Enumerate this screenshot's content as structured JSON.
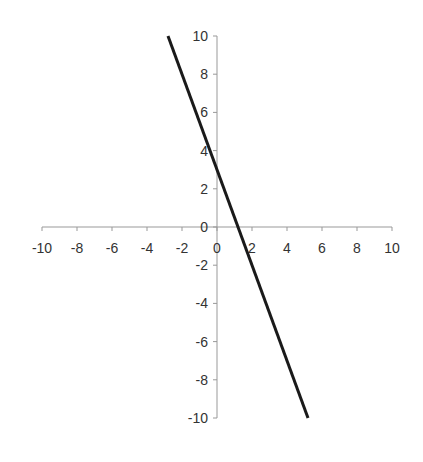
{
  "chart_data": {
    "type": "line",
    "title": "",
    "xlabel": "",
    "ylabel": "",
    "xlim": [
      -10,
      10
    ],
    "ylim": [
      -10,
      10
    ],
    "grid": false,
    "legend": null,
    "x_ticks": [
      -10,
      -8,
      -6,
      -4,
      -2,
      0,
      2,
      4,
      6,
      8,
      10
    ],
    "y_ticks": [
      10,
      8,
      6,
      4,
      2,
      0,
      -2,
      -4,
      -6,
      -8,
      -10
    ],
    "series": [
      {
        "name": "y = -2.5x + 3",
        "x": [
          -2.8,
          5.2
        ],
        "y": [
          10,
          -10
        ],
        "color": "#1a1a1a"
      }
    ]
  },
  "colors": {
    "axis": "#999999",
    "line": "#1a1a1a",
    "label": "#333333"
  }
}
